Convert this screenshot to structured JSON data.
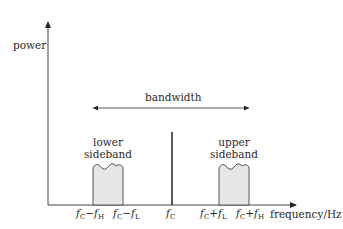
{
  "diagram": {
    "axes": {
      "y_label": "power",
      "x_label": "frequency/Hz"
    },
    "bandwidth_label": "bandwidth",
    "lower_sideband": {
      "line1": "lower",
      "line2": "sideband"
    },
    "upper_sideband": {
      "line1": "upper",
      "line2": "sideband"
    },
    "ticks": {
      "fc_minus_fh": {
        "f": "f",
        "sub1": "C",
        "op": "−",
        "f2": "f",
        "sub2": "H"
      },
      "fc_minus_fl": {
        "f": "f",
        "sub1": "C",
        "op": "−",
        "f2": "f",
        "sub2": "L"
      },
      "fc": {
        "f": "f",
        "sub1": "C"
      },
      "fc_plus_fl": {
        "f": "f",
        "sub1": "C",
        "op": "+",
        "f2": "f",
        "sub2": "L"
      },
      "fc_plus_fh": {
        "f": "f",
        "sub1": "C",
        "op": "+",
        "f2": "f",
        "sub2": "H"
      }
    },
    "colors": {
      "line": "#333333",
      "sideband_fill": "#e6e6e6"
    }
  }
}
